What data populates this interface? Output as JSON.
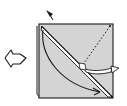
{
  "diagram": {
    "type": "origami-fold-step",
    "colors": {
      "paper": "#d4d4d4",
      "line": "#1a1a1a",
      "background": "#ffffff"
    },
    "elements": {
      "step_arrow": "hollow-arrow-pointing-right",
      "marker": "black-triangle-pointer",
      "paper": "square-sheet",
      "fold_line": "diagonal-valley-fold",
      "dotted_line": "diagonal-crease",
      "arrows": [
        "curved-fold-arrow",
        "pull-out-arrow"
      ]
    }
  }
}
